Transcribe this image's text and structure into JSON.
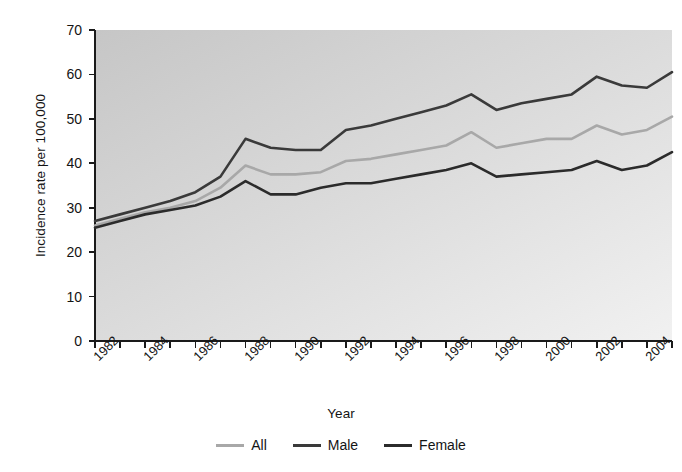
{
  "chart_data": {
    "type": "line",
    "title": "",
    "xlabel": "Year",
    "ylabel": "Incidence rate per 100,000",
    "xlim": [
      1982,
      2005
    ],
    "ylim": [
      0,
      70
    ],
    "grid": false,
    "legend_position": "bottom",
    "y_ticks": [
      0,
      10,
      20,
      30,
      40,
      50,
      60,
      70
    ],
    "y_tick_labels": [
      "0",
      "10",
      "20",
      "30",
      "40",
      "50",
      "60",
      "70"
    ],
    "x_ticks": [
      1982,
      1984,
      1986,
      1988,
      1990,
      1992,
      1994,
      1996,
      1998,
      2000,
      2002,
      2004
    ],
    "x_tick_labels": [
      "1982",
      "1984",
      "1986",
      "1988",
      "1990",
      "1992",
      "1994",
      "1996",
      "1998",
      "2000",
      "2002",
      "2004"
    ],
    "x_minor_ticks": [
      1983,
      1985,
      1987,
      1989,
      1991,
      1993,
      1995,
      1997,
      1999,
      2001,
      2003,
      2005
    ],
    "x": [
      1982,
      1983,
      1984,
      1985,
      1986,
      1987,
      1988,
      1989,
      1990,
      1991,
      1992,
      1993,
      1994,
      1995,
      1996,
      1997,
      1998,
      1999,
      2000,
      2001,
      2002,
      2003,
      2004,
      2005
    ],
    "series": [
      {
        "name": "All",
        "color": "#a8a8a8",
        "values": [
          26.0,
          27.5,
          29.0,
          30.0,
          31.5,
          34.5,
          39.5,
          37.5,
          37.5,
          38.0,
          40.5,
          41.0,
          42.0,
          43.0,
          44.0,
          47.0,
          43.5,
          44.5,
          45.5,
          45.5,
          48.5,
          46.5,
          47.5,
          50.5
        ]
      },
      {
        "name": "Male",
        "color": "#3a3a3a",
        "values": [
          27.0,
          28.5,
          30.0,
          31.5,
          33.5,
          37.0,
          45.5,
          43.5,
          43.0,
          43.0,
          47.5,
          48.5,
          50.0,
          51.5,
          53.0,
          55.5,
          52.0,
          53.5,
          54.5,
          55.5,
          59.5,
          57.5,
          57.0,
          60.5
        ]
      },
      {
        "name": "Female",
        "color": "#2b2b2b",
        "values": [
          25.5,
          27.0,
          28.5,
          29.5,
          30.5,
          32.5,
          36.0,
          33.0,
          33.0,
          34.5,
          35.5,
          35.5,
          36.5,
          37.5,
          38.5,
          40.0,
          37.0,
          37.5,
          38.0,
          38.5,
          40.5,
          38.5,
          39.5,
          42.5
        ]
      }
    ]
  },
  "legend": {
    "items": [
      {
        "label": "All",
        "color": "#a8a8a8"
      },
      {
        "label": "Male",
        "color": "#3a3a3a"
      },
      {
        "label": "Female",
        "color": "#2b2b2b"
      }
    ]
  },
  "plot_style": {
    "background_top_left": "#c9c9c9",
    "background_bottom_right": "#efefef",
    "axis_color": "#1a1a1a"
  }
}
